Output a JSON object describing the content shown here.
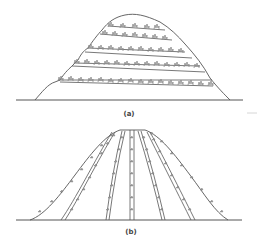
{
  "figure": {
    "panels": [
      {
        "id": "a",
        "label": "(a)",
        "description": "Terraced hill with contour plantings"
      },
      {
        "id": "b",
        "label": "(b)",
        "description": "Hill with up-and-down slope row plantings"
      }
    ],
    "colors": {
      "line": "#555555",
      "plant": "#8a8a8a",
      "background": "#ffffff"
    }
  }
}
